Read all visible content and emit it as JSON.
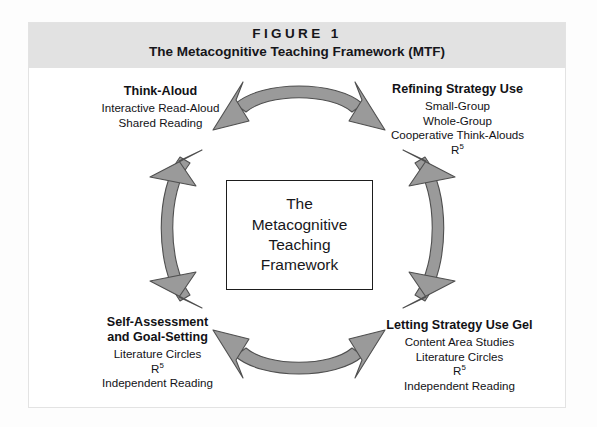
{
  "figure": {
    "number_label": "F I G U R E  1",
    "number_plain": "FIGURE 1",
    "title": "The Metacognitive Teaching Framework (MTF)"
  },
  "center": {
    "text": "The\nMetacognitive\nTeaching\nFramework"
  },
  "quadrants": [
    {
      "id": "think-aloud",
      "position": "top-left",
      "heading": "Think-Aloud",
      "items": [
        "Interactive Read-Aloud",
        "Shared Reading"
      ]
    },
    {
      "id": "refining-strategy-use",
      "position": "top-right",
      "heading": "Refining Strategy Use",
      "items": [
        "Small-Group",
        "Whole-Group",
        "Cooperative Think-Alouds",
        "R5"
      ]
    },
    {
      "id": "self-assessment-and-goal-setting",
      "position": "bottom-left",
      "heading": "Self-Assessment\nand Goal-Setting",
      "items": [
        "Literature Circles",
        "R5",
        "Independent Reading"
      ]
    },
    {
      "id": "letting-strategy-use-gel",
      "position": "bottom-right",
      "heading": "Letting Strategy Use Gel",
      "items": [
        "Content Area Studies",
        "Literature Circles",
        "R5",
        "Independent Reading"
      ]
    }
  ],
  "arrows": [
    {
      "id": "arrow-top",
      "name": "double-arrow-top",
      "direction": "bidirectional",
      "connects": [
        "think-aloud",
        "refining-strategy-use"
      ]
    },
    {
      "id": "arrow-right",
      "name": "double-arrow-right",
      "direction": "bidirectional",
      "connects": [
        "refining-strategy-use",
        "letting-strategy-use-gel"
      ]
    },
    {
      "id": "arrow-bottom",
      "name": "double-arrow-bottom",
      "direction": "bidirectional",
      "connects": [
        "letting-strategy-use-gel",
        "self-assessment-and-goal-setting"
      ]
    },
    {
      "id": "arrow-left",
      "name": "double-arrow-left",
      "direction": "bidirectional",
      "connects": [
        "self-assessment-and-goal-setting",
        "think-aloud"
      ]
    }
  ],
  "colors": {
    "header_band": "#e2e2e2",
    "arrow_fill": "#9a9a9a",
    "arrow_stroke": "#4f4f4f",
    "text": "#17171b",
    "box_border": "#1d1d1d",
    "page_background": "#fdfdfd"
  }
}
